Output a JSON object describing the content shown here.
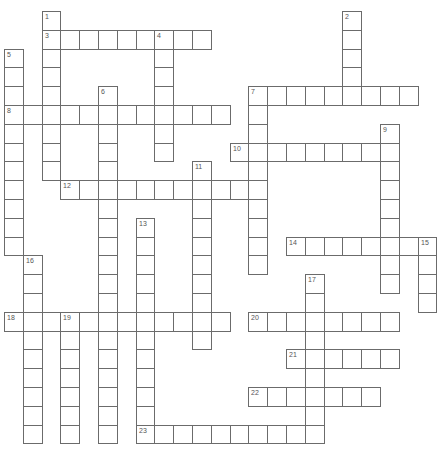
{
  "puzzle": {
    "type": "crossword",
    "grid": {
      "origin_x": 4,
      "origin_y": 11,
      "cell_size": 18.8
    },
    "line_color": "#6b6b6b",
    "number_color": "#555555",
    "entries": [
      {
        "number": "1",
        "direction": "down",
        "row": 0,
        "col": 2,
        "length": 9
      },
      {
        "number": "2",
        "direction": "down",
        "row": 0,
        "col": 18,
        "length": 5
      },
      {
        "number": "3",
        "direction": "across",
        "row": 1,
        "col": 2,
        "length": 9
      },
      {
        "number": "4",
        "direction": "down",
        "row": 1,
        "col": 8,
        "length": 7
      },
      {
        "number": "5",
        "direction": "down",
        "row": 2,
        "col": 0,
        "length": 11
      },
      {
        "number": "6",
        "direction": "down",
        "row": 4,
        "col": 5,
        "length": 19
      },
      {
        "number": "7",
        "direction": "across",
        "row": 4,
        "col": 13,
        "length": 9
      },
      {
        "number": "7",
        "direction": "down",
        "row": 4,
        "col": 13,
        "length": 10
      },
      {
        "number": "8",
        "direction": "across",
        "row": 5,
        "col": 0,
        "length": 12
      },
      {
        "number": "9",
        "direction": "down",
        "row": 6,
        "col": 20,
        "length": 9
      },
      {
        "number": "10",
        "direction": "across",
        "row": 7,
        "col": 12,
        "length": 9
      },
      {
        "number": "11",
        "direction": "down",
        "row": 8,
        "col": 10,
        "length": 10
      },
      {
        "number": "12",
        "direction": "across",
        "row": 9,
        "col": 3,
        "length": 11
      },
      {
        "number": "13",
        "direction": "down",
        "row": 11,
        "col": 7,
        "length": 12
      },
      {
        "number": "14",
        "direction": "across",
        "row": 12,
        "col": 15,
        "length": 8
      },
      {
        "number": "15",
        "direction": "down",
        "row": 12,
        "col": 22,
        "length": 4
      },
      {
        "number": "16",
        "direction": "down",
        "row": 13,
        "col": 1,
        "length": 10
      },
      {
        "number": "17",
        "direction": "down",
        "row": 14,
        "col": 16,
        "length": 9
      },
      {
        "number": "18",
        "direction": "across",
        "row": 16,
        "col": 0,
        "length": 12
      },
      {
        "number": "19",
        "direction": "down",
        "row": 16,
        "col": 3,
        "length": 7
      },
      {
        "number": "20",
        "direction": "across",
        "row": 16,
        "col": 13,
        "length": 8
      },
      {
        "number": "21",
        "direction": "across",
        "row": 18,
        "col": 15,
        "length": 6
      },
      {
        "number": "22",
        "direction": "across",
        "row": 20,
        "col": 13,
        "length": 7
      },
      {
        "number": "23",
        "direction": "across",
        "row": 22,
        "col": 7,
        "length": 10
      }
    ]
  }
}
